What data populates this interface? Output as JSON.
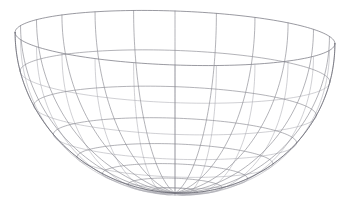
{
  "scene": {
    "title": "3D wireframe hemisphere bowl",
    "object_name": "hemisphere-wireframe",
    "background_color": "#ffffff",
    "line_color_front": "#8a8a92",
    "line_color_back": "#a8a8b0",
    "line_color_rim": "#6e6e78",
    "line_color_silhouette": "#5e5e68",
    "line_width": 0.65,
    "projection": "orthographic",
    "canvas": {
      "width": 351,
      "height": 209
    }
  },
  "geometry": {
    "type": "hemisphere-wireframe",
    "shape": "bowl",
    "orientation": "opening-upward",
    "radius": 160,
    "center_x": 175,
    "rim_center_y": 38,
    "rim_semi_axis_x": 160,
    "rim_semi_axis_y": 27,
    "bottom_y": 193,
    "depth": 155,
    "meridian_count": 24,
    "latitude_count": 8,
    "tilt_degrees": 2.0,
    "view_elevation_degrees": 9.6,
    "latitude_fractions": [
      0.0,
      0.16,
      0.31,
      0.45,
      0.58,
      0.7,
      0.81,
      0.91,
      1.0
    ],
    "closed_bottom": false,
    "bottom_truncated": true
  },
  "chart_data": {
    "type": "scatter",
    "xlabel": "",
    "ylabel": "",
    "parameterization": {
      "u_name": "azimuth",
      "u_range_degrees": [
        0,
        360
      ],
      "u_steps": 24,
      "v_name": "polar",
      "v_range_degrees": [
        0,
        90
      ],
      "v_steps": 8
    },
    "axis_ranges": {
      "x": [
        -1,
        1
      ],
      "y": [
        -1,
        1
      ],
      "z": [
        -1,
        0
      ]
    },
    "grid": true,
    "legend": "none"
  }
}
